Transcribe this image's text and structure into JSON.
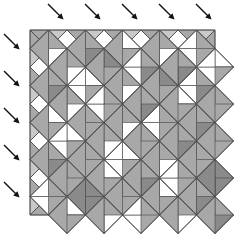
{
  "figure": {
    "kind": "geometric-tiling-diagram",
    "width": 239,
    "height": 234,
    "background_color": "#ffffff"
  },
  "palette": {
    "white": "#ffffff",
    "light_gray": "#c9c9c9",
    "mid_gray": "#a8a8a8",
    "dark_gray": "#8a8a8a",
    "outline": "#4a4a4a",
    "arrow": "#111111"
  },
  "lattice": {
    "origin_x": 30,
    "origin_y": 30,
    "pitch": 37,
    "columns": 5,
    "rows": 5,
    "cell_shape": "diamond",
    "subdivision": "each diamond split by both diagonals into 4 quadrant triangles; some quadrants further bisected",
    "edge_cells": "half-diamond triangles along all four borders"
  },
  "arrows": {
    "count_top": 5,
    "count_left": 6,
    "direction": "down-right-45deg",
    "length": 22,
    "head_size": 6,
    "color": "#111111",
    "top_positions": [
      {
        "x": 48,
        "y": 4
      },
      {
        "x": 85,
        "y": 4
      },
      {
        "x": 122,
        "y": 4
      },
      {
        "x": 159,
        "y": 4
      },
      {
        "x": 196,
        "y": 4
      }
    ],
    "left_positions": [
      {
        "x": 4,
        "y": 34
      },
      {
        "x": 4,
        "y": 71
      },
      {
        "x": 4,
        "y": 108
      },
      {
        "x": 4,
        "y": 145
      },
      {
        "x": 4,
        "y": 182
      }
    ]
  },
  "chart_data": {
    "type": "heatmap",
    "xlabel": "",
    "ylabel": "",
    "grid": true,
    "legend": "none",
    "note": "Each grid node hosts a diamond divided into four quadrant triangles (top, right, bottom, left). Tone index 0=white, 1=light gray, 2=mid gray, 3=dark gray. Quadrants marked with a nested pair are bisected into two sub-triangles.",
    "tones": [
      "#ffffff",
      "#c9c9c9",
      "#a8a8a8",
      "#8a8a8a"
    ],
    "categories": [
      "col1",
      "col2",
      "col3",
      "col4",
      "col5"
    ],
    "rows": [
      "row1",
      "row2",
      "row3",
      "row4",
      "row5"
    ],
    "cells": [
      [
        {
          "top": 2,
          "right": 2,
          "bottom": 0,
          "left": 2,
          "split": [
            "bottom"
          ]
        },
        {
          "top": 0,
          "right": 2,
          "bottom": 3,
          "left": 2,
          "split": [
            "top"
          ]
        },
        {
          "top": 2,
          "right": 0,
          "bottom": 2,
          "left": 2,
          "split": [
            "right"
          ]
        },
        {
          "top": 3,
          "right": 2,
          "bottom": 0,
          "left": 2,
          "split": [
            "bottom"
          ]
        },
        {
          "top": 2,
          "right": 2,
          "bottom": 2,
          "left": 0,
          "split": [
            "left"
          ]
        }
      ],
      [
        {
          "top": 3,
          "right": 2,
          "bottom": 3,
          "left": 2,
          "split": [
            "top",
            "bottom"
          ]
        },
        {
          "top": 2,
          "right": 0,
          "bottom": 2,
          "left": 0,
          "split": [
            "right",
            "left"
          ]
        },
        {
          "top": 0,
          "right": 2,
          "bottom": 0,
          "left": 2,
          "split": [
            "top",
            "bottom"
          ]
        },
        {
          "top": 3,
          "right": 3,
          "bottom": 2,
          "left": 2,
          "split": [
            "top"
          ]
        },
        {
          "top": 2,
          "right": 2,
          "bottom": 3,
          "left": 0,
          "split": [
            "left"
          ]
        }
      ],
      [
        {
          "top": 2,
          "right": 0,
          "bottom": 2,
          "left": 2,
          "split": [
            "right"
          ]
        },
        {
          "top": 0,
          "right": 2,
          "bottom": 2,
          "left": 2,
          "split": [
            "top"
          ]
        },
        {
          "top": 2,
          "right": 2,
          "bottom": 0,
          "left": 2,
          "split": [
            "bottom"
          ]
        },
        {
          "top": 2,
          "right": 2,
          "bottom": 2,
          "left": 0,
          "split": [
            "left"
          ]
        },
        {
          "top": 3,
          "right": 2,
          "bottom": 3,
          "left": 2,
          "split": [
            "top",
            "bottom"
          ]
        }
      ],
      [
        {
          "top": 0,
          "right": 2,
          "bottom": 3,
          "left": 2,
          "split": [
            "top"
          ]
        },
        {
          "top": 2,
          "right": 2,
          "bottom": 2,
          "left": 2,
          "split": []
        },
        {
          "top": 2,
          "right": 0,
          "bottom": 2,
          "left": 0,
          "split": [
            "right",
            "left"
          ]
        },
        {
          "top": 3,
          "right": 2,
          "bottom": 0,
          "left": 2,
          "split": [
            "bottom"
          ]
        },
        {
          "top": 2,
          "right": 2,
          "bottom": 2,
          "left": 2,
          "split": []
        }
      ],
      [
        {
          "top": 2,
          "right": 2,
          "bottom": 2,
          "left": 0,
          "split": [
            "left"
          ]
        },
        {
          "top": 3,
          "right": 3,
          "bottom": 3,
          "left": 3,
          "split": [
            "top",
            "bottom"
          ]
        },
        {
          "top": 0,
          "right": 2,
          "bottom": 2,
          "left": 2,
          "split": [
            "top"
          ]
        },
        {
          "top": 2,
          "right": 0,
          "bottom": 2,
          "left": 2,
          "split": [
            "right"
          ]
        },
        {
          "top": 3,
          "right": 2,
          "bottom": 3,
          "left": 2,
          "split": [
            "top",
            "bottom"
          ]
        }
      ]
    ],
    "edge_top": [
      {
        "fill": 2,
        "split": true
      },
      {
        "fill": 2,
        "split": true
      },
      {
        "fill": 2,
        "split": true
      },
      {
        "fill": 2,
        "split": true
      },
      {
        "fill": 2,
        "split": true
      }
    ],
    "edge_bottom": [
      {
        "fill": 2,
        "split": true
      },
      {
        "fill": 2,
        "split": true
      },
      {
        "fill": 2,
        "split": true
      },
      {
        "fill": 2,
        "split": true
      },
      {
        "fill": 2,
        "split": true
      }
    ],
    "edge_left": [
      {
        "fill": 2,
        "split": true
      },
      {
        "fill": 2,
        "split": true
      },
      {
        "fill": 2,
        "split": true
      },
      {
        "fill": 2,
        "split": true
      },
      {
        "fill": 2,
        "split": true
      }
    ],
    "edge_right": [
      {
        "fill": 2,
        "split": true
      },
      {
        "fill": 2,
        "split": true
      },
      {
        "fill": 2,
        "split": true
      },
      {
        "fill": 2,
        "split": true
      },
      {
        "fill": 2,
        "split": true
      }
    ]
  }
}
